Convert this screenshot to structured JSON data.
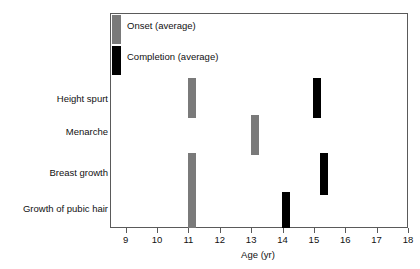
{
  "chart_data": {
    "type": "bar",
    "orientation": "horizontal-markers",
    "title": "",
    "xlabel": "Age (yr)",
    "ylabel": "",
    "xlim": [
      8.5,
      18
    ],
    "xticks": [
      9,
      10,
      11,
      12,
      13,
      14,
      15,
      16,
      17,
      18
    ],
    "xtick_labels": [
      "9",
      "10",
      "11",
      "12",
      "13",
      "14",
      "15",
      "16",
      "17",
      "18"
    ],
    "grid": false,
    "legend_position": "inside-top-left",
    "categories": [
      "Height spurt",
      "Menarche",
      "Breast growth",
      "Growth of pubic hair"
    ],
    "series": [
      {
        "name": "Onset (average)",
        "color": "#7a7a7a",
        "values": [
          11.0,
          13.0,
          11.0,
          11.0
        ]
      },
      {
        "name": "Completion (average)",
        "color": "#000000",
        "values": [
          15.0,
          null,
          15.2,
          14.0
        ]
      }
    ],
    "points": [
      {
        "category": "Height spurt",
        "series": "Onset (average)",
        "age": 11.0,
        "color": "#7a7a7a"
      },
      {
        "category": "Height spurt",
        "series": "Completion (average)",
        "age": 15.0,
        "color": "#000000"
      },
      {
        "category": "Menarche",
        "series": "Onset (average)",
        "age": 13.0,
        "color": "#7a7a7a"
      },
      {
        "category": "Breast growth",
        "series": "Onset (average)",
        "age": 11.0,
        "color": "#7a7a7a"
      },
      {
        "category": "Breast growth",
        "series": "Completion (average)",
        "age": 15.2,
        "color": "#000000"
      },
      {
        "category": "Growth of pubic hair",
        "series": "Onset (average)",
        "age": 11.0,
        "color": "#7a7a7a"
      },
      {
        "category": "Growth of pubic hair",
        "series": "Completion (average)",
        "age": 14.0,
        "color": "#000000"
      }
    ]
  },
  "legend": {
    "items": [
      {
        "label": "Onset (average)",
        "color": "#7a7a7a"
      },
      {
        "label": "Completion (average)",
        "color": "#000000"
      }
    ]
  },
  "axis": {
    "x_title": "Age (yr)"
  }
}
